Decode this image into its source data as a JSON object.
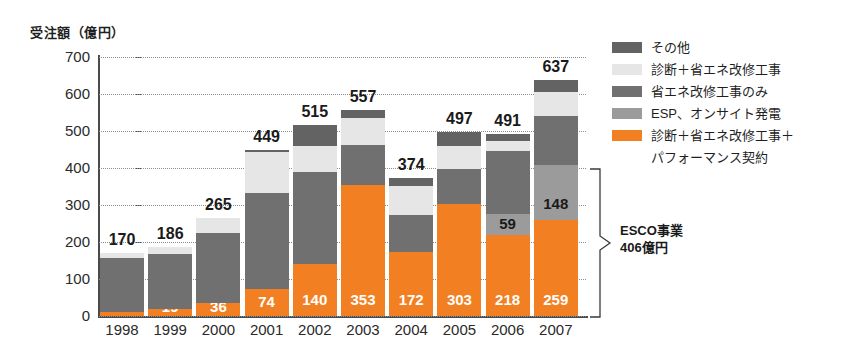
{
  "chart_data": {
    "type": "bar",
    "stacked": true,
    "title": "",
    "ylabel": "受注額（億円）",
    "xlabel": "",
    "ylim": [
      0,
      700
    ],
    "ytick_step": 100,
    "yticks": [
      "0",
      "100",
      "200",
      "300",
      "400",
      "500",
      "600",
      "700"
    ],
    "grid": true,
    "legend_position": "right",
    "categories": [
      "1998",
      "1999",
      "2000",
      "2001",
      "2002",
      "2003",
      "2004",
      "2005",
      "2006",
      "2007"
    ],
    "totals": [
      170,
      186,
      265,
      449,
      515,
      557,
      374,
      497,
      491,
      637
    ],
    "series": [
      {
        "name": "診断＋省エネ改修工事＋パフォーマンス契約",
        "color": "#F28022",
        "values": [
          10,
          19,
          36,
          74,
          140,
          353,
          172,
          303,
          218,
          259
        ],
        "labels": [
          "10",
          "19",
          "36",
          "74",
          "140",
          "353",
          "172",
          "303",
          "218",
          "259"
        ],
        "label_color": "#ffffff"
      },
      {
        "name": "ESP、オンサイト発電",
        "color": "#9b9b9b",
        "values": [
          0,
          0,
          0,
          0,
          0,
          0,
          0,
          0,
          59,
          148
        ],
        "labels": [
          "",
          "",
          "",
          "",
          "",
          "",
          "",
          "",
          "59",
          "148"
        ],
        "label_color": "#1a1a1a"
      },
      {
        "name": "省エネ改修工事のみ",
        "color": "#707070",
        "values": [
          148,
          148,
          188,
          258,
          250,
          110,
          100,
          93,
          170,
          133
        ],
        "labels": [
          "",
          "",
          "",
          "",
          "",
          "",
          "",
          "",
          "",
          ""
        ],
        "label_color": "#ffffff"
      },
      {
        "name": "診断＋省エネ改修工事",
        "color": "#e6e6e6",
        "values": [
          12,
          19,
          41,
          110,
          70,
          71,
          80,
          64,
          27,
          65
        ],
        "labels": [
          "",
          "",
          "",
          "",
          "",
          "",
          "",
          "",
          "",
          ""
        ],
        "label_color": "#1a1a1a"
      },
      {
        "name": "その他",
        "color": "#636363",
        "values": [
          0,
          0,
          0,
          7,
          55,
          23,
          22,
          37,
          17,
          32
        ],
        "labels": [
          "",
          "",
          "",
          "",
          "",
          "",
          "",
          "",
          "",
          ""
        ],
        "label_color": "#ffffff"
      }
    ]
  },
  "legend": {
    "items": [
      {
        "label": "その他",
        "color": "#636363"
      },
      {
        "label": "診断＋省エネ改修工事",
        "color": "#e6e6e6"
      },
      {
        "label": "省エネ改修工事のみ",
        "color": "#707070"
      },
      {
        "label": "ESP、オンサイト発電",
        "color": "#9b9b9b"
      },
      {
        "label": "診断＋省エネ改修工事＋",
        "color": "#F28022"
      }
    ],
    "last_item_line2": "パフォーマンス契約"
  },
  "annotation": {
    "esco_line1": "ESCO事業",
    "esco_line2": "406億円"
  }
}
